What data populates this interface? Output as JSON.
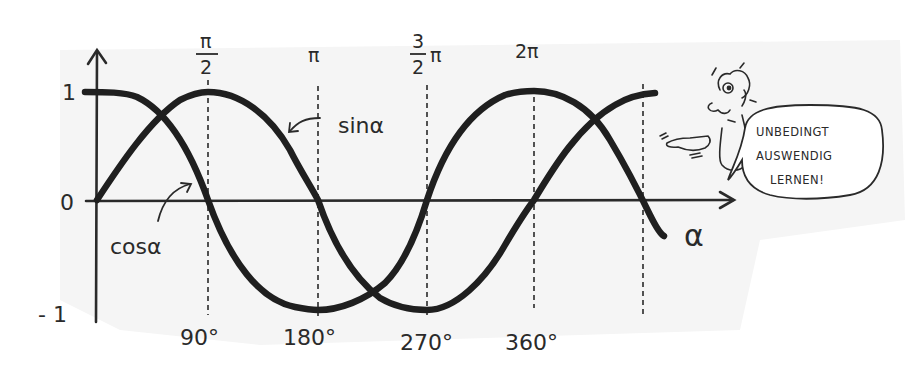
{
  "diagram": {
    "y_axis": {
      "tick_labels": [
        {
          "value": 1,
          "text": "1"
        },
        {
          "value": 0,
          "text": "0"
        },
        {
          "value": -1,
          "text": "- 1"
        }
      ]
    },
    "x_axis": {
      "label": "α",
      "radian_labels": [
        {
          "text_top": "π",
          "text_bottom": "2",
          "display": "π/2"
        },
        {
          "text": "π"
        },
        {
          "text_top": "3",
          "text_bottom": "2",
          "suffix": "π",
          "display": "3/2π"
        },
        {
          "text": "2π"
        }
      ],
      "degree_labels": [
        "90°",
        "180°",
        "270°",
        "360°"
      ]
    },
    "curve_labels": {
      "sin": "sinα",
      "cos": "cosα"
    },
    "speech_bubble": {
      "lines": [
        "UNBEDINGT",
        "AUSWENDIG",
        "LERNEN!"
      ]
    },
    "colors": {
      "ink": "#2a2a2a",
      "curve": "#1f1f1f",
      "background": "#ffffff",
      "paper_shade": "#f3f3f3"
    }
  }
}
